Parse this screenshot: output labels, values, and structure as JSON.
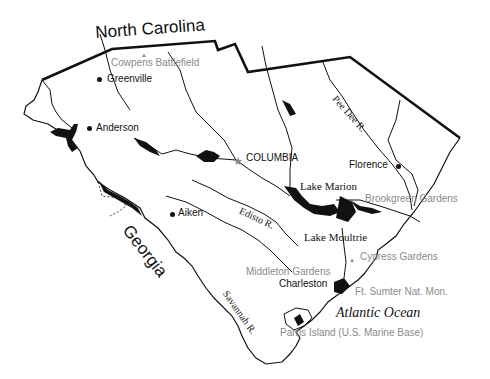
{
  "map": {
    "title": "South Carolina",
    "neighbors": {
      "north": "North Carolina",
      "southwest": "Georgia",
      "ocean": "Atlantic Ocean"
    },
    "cities": [
      {
        "name": "Greenville",
        "x": 98,
        "y": 80
      },
      {
        "name": "Anderson",
        "x": 89,
        "y": 129
      },
      {
        "name": "COLUMBIA",
        "x": 238,
        "y": 161,
        "capital": true
      },
      {
        "name": "Florence",
        "x": 397,
        "y": 166
      },
      {
        "name": "Aiken",
        "x": 171,
        "y": 213
      },
      {
        "name": "Charleston",
        "x": 339,
        "y": 283
      }
    ],
    "lakes": [
      "Lake Marion",
      "Lake Moultrie"
    ],
    "rivers": [
      "Pee Dee R.",
      "Edisto R.",
      "Savannah R."
    ],
    "points_of_interest": [
      "Cowpens Battlefield",
      "Brookgreen Gardens",
      "Cypress Gardens",
      "Middleton Gardens",
      "Ft. Sumter Nat. Mon.",
      "Parris Island (U.S. Marine Base)"
    ],
    "colors": {
      "ink": "#111111",
      "poi_gray": "#8a8a8a",
      "background": "#ffffff"
    }
  }
}
